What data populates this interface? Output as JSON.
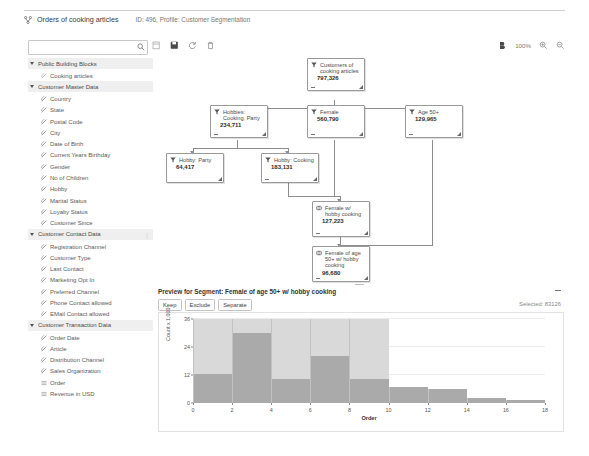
{
  "header": {
    "icon": "segmentation-icon",
    "title": "Orders of cooking articles",
    "meta": "ID: 496, Profile: Customer Segmentation"
  },
  "toolbar": {
    "search_value": "",
    "search_placeholder": "",
    "search_icon": "search-icon",
    "icons": [
      {
        "name": "copy-icon",
        "glyph": "copy"
      },
      {
        "name": "save-icon",
        "glyph": "save"
      },
      {
        "name": "refresh-icon",
        "glyph": "refresh"
      },
      {
        "name": "delete-icon",
        "glyph": "trash"
      }
    ],
    "right": {
      "fit_icon": "fit-to-screen-icon",
      "zoom_level": "100%",
      "zoom_in_icon": "zoom-in-icon",
      "zoom_out_icon": "zoom-out-icon"
    }
  },
  "sidebar": {
    "groups": [
      {
        "label": "Public Building Blocks",
        "dots": "",
        "items": [
          {
            "label": "Cooking articles",
            "icon": "block-icon",
            "muted": true
          }
        ]
      },
      {
        "label": "Customer Master Data",
        "dots": "",
        "items": [
          {
            "label": "Country",
            "icon": "attribute-icon"
          },
          {
            "label": "State",
            "icon": "attribute-icon"
          },
          {
            "label": "Postal Code",
            "icon": "attribute-icon"
          },
          {
            "label": "City",
            "icon": "attribute-icon"
          },
          {
            "label": "Date of Birth",
            "icon": "attribute-icon"
          },
          {
            "label": "Current Years Birthday",
            "icon": "attribute-icon"
          },
          {
            "label": "Gender",
            "icon": "attribute-icon"
          },
          {
            "label": "No of Children",
            "icon": "attribute-icon"
          },
          {
            "label": "Hobby",
            "icon": "attribute-icon"
          },
          {
            "label": "Marital Status",
            "icon": "attribute-icon"
          },
          {
            "label": "Loyalty Status",
            "icon": "attribute-icon"
          },
          {
            "label": "Customer Since",
            "icon": "attribute-icon"
          }
        ]
      },
      {
        "label": "Customer Contact Data",
        "dots": "⋮",
        "items": [
          {
            "label": "Registration Channel",
            "icon": "attribute-icon"
          },
          {
            "label": "Customer Type",
            "icon": "attribute-icon"
          },
          {
            "label": "Last Contact",
            "icon": "attribute-icon"
          },
          {
            "label": "Marketing Opt In",
            "icon": "attribute-icon"
          },
          {
            "label": "Preferred Channel",
            "icon": "attribute-icon"
          },
          {
            "label": "Phone Contact allowed",
            "icon": "attribute-icon"
          },
          {
            "label": "EMail Contact allowed",
            "icon": "attribute-icon"
          }
        ]
      },
      {
        "label": "Customer Transaction Data",
        "dots": "",
        "items": [
          {
            "label": "Order Date",
            "icon": "attribute-icon"
          },
          {
            "label": "Article",
            "icon": "attribute-icon"
          },
          {
            "label": "Distribution Channel",
            "icon": "attribute-icon"
          },
          {
            "label": "Sales Organization",
            "icon": "attribute-icon"
          },
          {
            "label": "Order",
            "icon": "measure-icon"
          },
          {
            "label": "Revenue in USD",
            "icon": "measure-icon"
          }
        ]
      }
    ]
  },
  "tree": {
    "nodes": [
      {
        "id": "root",
        "title": "Customers of cooking articles",
        "value": "797,326",
        "icon": "filter-icon",
        "has_minus": true
      },
      {
        "id": "hobbies",
        "title": "Hobbies: Cooking, Party",
        "value": "234,711",
        "icon": "filter-icon",
        "has_minus": true
      },
      {
        "id": "female",
        "title": "Female",
        "value": "560,790",
        "icon": "filter-icon",
        "has_minus": true
      },
      {
        "id": "age50",
        "title": "Age 50+",
        "value": "129,965",
        "icon": "filter-icon",
        "has_minus": true
      },
      {
        "id": "party",
        "title": "Hobby: Party",
        "value": "64,417",
        "icon": "filter-icon",
        "has_minus": false
      },
      {
        "id": "cooking",
        "title": "Hobby: Cooking",
        "value": "183,131",
        "icon": "filter-icon",
        "has_minus": true
      },
      {
        "id": "femcook",
        "title": "Female w/ hobby cooking",
        "value": "127,223",
        "icon": "intersect-icon",
        "has_minus": true
      },
      {
        "id": "fem50cook",
        "title": "Female of age 50+ w/ hobby cooking",
        "value": "96,680",
        "icon": "intersect-icon",
        "has_minus": true
      }
    ]
  },
  "preview": {
    "title": "Preview for Segment: Female of age 50+ w/ hobby cooking",
    "buttons": [
      {
        "label": "Keep",
        "name": "keep-button"
      },
      {
        "label": "Exclude",
        "name": "exclude-button"
      },
      {
        "label": "Separate",
        "name": "separate-button"
      }
    ],
    "selected_text": "Selected: 83126",
    "collapse_icon": "collapse-icon"
  },
  "chart_data": {
    "type": "bar",
    "title": "",
    "xlabel": "Order",
    "ylabel": "Count x 1,000",
    "xlim": [
      0,
      18
    ],
    "ylim": [
      0,
      36
    ],
    "xticks": [
      0,
      2,
      4,
      6,
      8,
      10,
      12,
      14,
      16,
      18
    ],
    "yticks": [
      0,
      12,
      24,
      36
    ],
    "grid": true,
    "bin_width": 2,
    "bin_starts": [
      0,
      2,
      4,
      6,
      8,
      10,
      12,
      14,
      16
    ],
    "series": [
      {
        "name": "Total",
        "color": "#d9d9d9",
        "values": [
          36,
          36,
          36,
          36,
          36,
          7,
          6,
          2,
          1.5
        ]
      },
      {
        "name": "Selected",
        "color": "#aaaaaa",
        "values": [
          12.5,
          30,
          10.5,
          20,
          10.5,
          7,
          6,
          2,
          1.5
        ]
      }
    ]
  }
}
